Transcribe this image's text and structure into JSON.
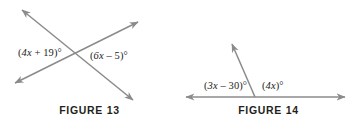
{
  "figures": [
    {
      "id": "figure-13",
      "caption": "FIGURE 13",
      "type": "two-intersecting-lines",
      "labels": [
        {
          "name": "fig13-left-angle",
          "text": "(4x + 19)°",
          "lead": "(",
          "var": "4x",
          "rest": " + 19)°"
        },
        {
          "name": "fig13-right-angle",
          "text": "(6x – 5)°",
          "lead": "(",
          "var": "6x",
          "rest": " – 5)°"
        }
      ],
      "geometry": {
        "intersection": [
          82,
          57
        ],
        "line_a": {
          "from": [
            22,
            10
          ],
          "to": [
            133,
            100
          ],
          "arrows": "both"
        },
        "line_b": {
          "from": [
            15,
            83
          ],
          "to": [
            138,
            22
          ],
          "arrows": "both"
        }
      }
    },
    {
      "id": "figure-14",
      "caption": "FIGURE 14",
      "type": "linear-pair",
      "labels": [
        {
          "name": "fig14-left-angle",
          "text": "(3x – 30)°",
          "lead": "(",
          "var": "3x",
          "rest": " – 30)°"
        },
        {
          "name": "fig14-right-angle",
          "text": "(4x)°",
          "lead": "(",
          "var": "4x",
          "rest": ")°"
        }
      ],
      "geometry": {
        "vertex": [
          255,
          97
        ],
        "base_line": {
          "from": [
            186,
            97
          ],
          "to": [
            345,
            97
          ],
          "arrows": "both"
        },
        "ray": {
          "from": [
            255,
            97
          ],
          "to": [
            232,
            44
          ],
          "arrows": "end"
        }
      }
    }
  ],
  "style": {
    "line_color": "#8b8b8b",
    "text_color": "#1c1c1c",
    "caption_color": "#231f20",
    "background": "#ffffff"
  }
}
